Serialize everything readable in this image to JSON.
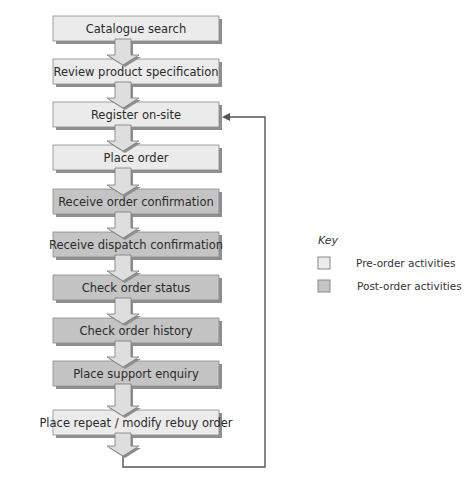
{
  "colors": {
    "pre_fill": "#ebebeb",
    "post_fill": "#c4c4c4",
    "border": "#8a8a8a",
    "shadow": "#8f8f8f",
    "arrow_fill": "#dedede",
    "line": "#555555"
  },
  "steps": [
    {
      "label": "Catalogue search",
      "type": "pre"
    },
    {
      "label": "Review product specification",
      "type": "pre"
    },
    {
      "label": "Register on-site",
      "type": "pre"
    },
    {
      "label": "Place order",
      "type": "pre"
    },
    {
      "label": "Receive order confirmation",
      "type": "post"
    },
    {
      "label": "Receive dispatch confirmation",
      "type": "post"
    },
    {
      "label": "Check order status",
      "type": "post"
    },
    {
      "label": "Check order history",
      "type": "post"
    },
    {
      "label": "Place support enquiry",
      "type": "post"
    },
    {
      "label": "Place repeat / modify rebuy order",
      "type": "pre"
    }
  ],
  "key": {
    "title": "Key",
    "items": [
      {
        "label": "Pre-order activities",
        "type": "pre"
      },
      {
        "label": "Post-order activities",
        "type": "post"
      }
    ]
  }
}
